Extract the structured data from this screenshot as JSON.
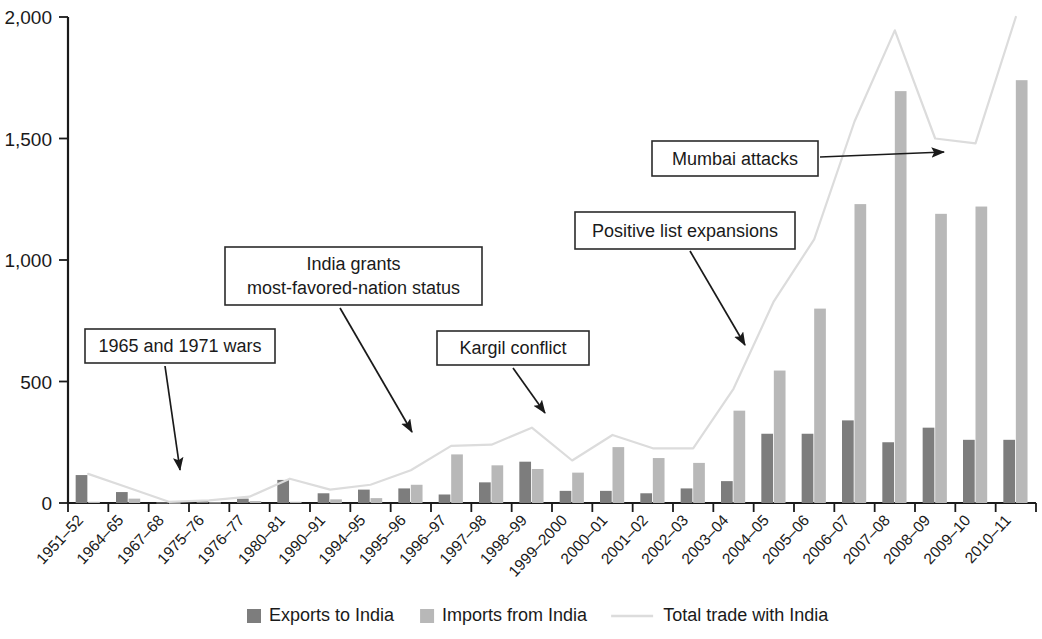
{
  "chart_data": {
    "type": "bar",
    "title": "",
    "subtitle": "",
    "xlabel": "",
    "ylabel": "",
    "ylim": [
      0,
      2000
    ],
    "yticks": [
      0,
      500,
      1000,
      1500,
      2000
    ],
    "ytick_labels": [
      "0",
      "500",
      "1,000",
      "1,500",
      "2,000"
    ],
    "grid": false,
    "legend_position": "bottom",
    "categories": [
      "1951–52",
      "1964–65",
      "1967–68",
      "1975–76",
      "1976–77",
      "1980–81",
      "1990–91",
      "1994–95",
      "1995–96",
      "1996–97",
      "1997–98",
      "1998–99",
      "1999–2000",
      "2000–01",
      "2001–02",
      "2002–03",
      "2003–04",
      "2004–05",
      "2005–06",
      "2006–07",
      "2007–08",
      "2008–09",
      "2009–10",
      "2010–11"
    ],
    "series": [
      {
        "name": "Exports to India",
        "type": "bar",
        "color": "#7d7d7d",
        "values": [
          115,
          45,
          3,
          8,
          18,
          95,
          40,
          55,
          60,
          35,
          85,
          170,
          50,
          50,
          40,
          60,
          90,
          285,
          285,
          340,
          250,
          310,
          260,
          260
        ]
      },
      {
        "name": "Imports from India",
        "type": "bar",
        "color": "#b8b8b8",
        "values": [
          5,
          18,
          2,
          3,
          8,
          5,
          15,
          20,
          75,
          200,
          155,
          140,
          125,
          230,
          185,
          165,
          380,
          545,
          800,
          1230,
          1695,
          1190,
          1220,
          1740
        ]
      },
      {
        "name": "Total trade with India",
        "type": "line",
        "color": "#dcdcdc",
        "values": [
          120,
          63,
          5,
          11,
          26,
          100,
          55,
          75,
          135,
          235,
          240,
          310,
          175,
          280,
          225,
          225,
          470,
          830,
          1085,
          1570,
          1945,
          1500,
          1480,
          2000
        ]
      }
    ],
    "annotations": [
      {
        "label": "1965 and 1971 wars",
        "lines": [
          "1965 and 1971 wars"
        ],
        "box": {
          "x": 85,
          "y": 329,
          "w": 190,
          "h": 34
        },
        "arrow": {
          "x1": 165,
          "y1": 366,
          "x2": 180,
          "y2": 470
        }
      },
      {
        "label": "India grants most-favored-nation status",
        "lines": [
          "India grants",
          "most-favored-nation status"
        ],
        "box": {
          "x": 225,
          "y": 247,
          "w": 257,
          "h": 58
        },
        "arrow": {
          "x1": 340,
          "y1": 308,
          "x2": 412,
          "y2": 432
        }
      },
      {
        "label": "Kargil conflict",
        "lines": [
          "Kargil conflict"
        ],
        "box": {
          "x": 437,
          "y": 331,
          "w": 152,
          "h": 34
        },
        "arrow": {
          "x1": 513,
          "y1": 368,
          "x2": 545,
          "y2": 413
        }
      },
      {
        "label": "Positive list expansions",
        "lines": [
          "Positive list expansions"
        ],
        "box": {
          "x": 575,
          "y": 212,
          "w": 220,
          "h": 37
        },
        "arrow": {
          "x1": 690,
          "y1": 251,
          "x2": 745,
          "y2": 345
        }
      },
      {
        "label": "Mumbai attacks",
        "lines": [
          "Mumbai attacks"
        ],
        "box": {
          "x": 652,
          "y": 141,
          "w": 166,
          "h": 35
        },
        "arrow": {
          "x1": 820,
          "y1": 157,
          "x2": 944,
          "y2": 152
        }
      }
    ]
  },
  "legend": {
    "items": [
      {
        "label": "Exports to India",
        "marker": "square",
        "color": "#7d7d7d"
      },
      {
        "label": "Imports from India",
        "marker": "square",
        "color": "#b8b8b8"
      },
      {
        "label": "Total trade with India",
        "marker": "line",
        "color": "#dcdcdc"
      }
    ]
  }
}
